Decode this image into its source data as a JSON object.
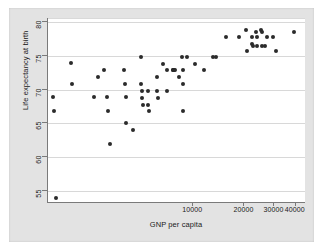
{
  "figure": {
    "background_color": "#e3e3e3",
    "plot_background_color": "#ffffff",
    "point_color": "#2b2b2b",
    "grid_color": "#d8d8d8",
    "axis_color": "#7a7a7a"
  },
  "chart_data": {
    "type": "scatter",
    "title": "",
    "xlabel": "GNP per capita",
    "ylabel": "Life expectancy at birth",
    "xscale": "log",
    "yscale": "linear",
    "grid": "horizontal",
    "legend": "none",
    "xlim": [
      1400,
      46000
    ],
    "ylim": [
      53.2,
      80.5
    ],
    "xticks": [
      10000,
      20000,
      30000,
      40000
    ],
    "xtick_labels": [
      "10000",
      "20000",
      "30000",
      "40000"
    ],
    "yticks": [
      55,
      60,
      65,
      70,
      75,
      80
    ],
    "ytick_labels": [
      "55",
      "60",
      "65",
      "70",
      "75",
      "80"
    ],
    "points": [
      {
        "x": 1500,
        "y": 68.9
      },
      {
        "x": 1520,
        "y": 66.9
      },
      {
        "x": 1560,
        "y": 54.0
      },
      {
        "x": 1900,
        "y": 74.0
      },
      {
        "x": 1950,
        "y": 70.9
      },
      {
        "x": 2600,
        "y": 68.9
      },
      {
        "x": 2750,
        "y": 71.9
      },
      {
        "x": 3000,
        "y": 72.9
      },
      {
        "x": 3100,
        "y": 68.9
      },
      {
        "x": 3150,
        "y": 66.9
      },
      {
        "x": 3250,
        "y": 62.0
      },
      {
        "x": 3900,
        "y": 72.9
      },
      {
        "x": 3950,
        "y": 70.9
      },
      {
        "x": 4000,
        "y": 68.9
      },
      {
        "x": 4050,
        "y": 65.0
      },
      {
        "x": 4400,
        "y": 64.0
      },
      {
        "x": 4900,
        "y": 74.9
      },
      {
        "x": 4950,
        "y": 70.9
      },
      {
        "x": 4980,
        "y": 69.8
      },
      {
        "x": 5000,
        "y": 68.8
      },
      {
        "x": 5050,
        "y": 67.8
      },
      {
        "x": 5400,
        "y": 69.8
      },
      {
        "x": 5450,
        "y": 67.8
      },
      {
        "x": 5500,
        "y": 66.8
      },
      {
        "x": 6100,
        "y": 71.9
      },
      {
        "x": 6150,
        "y": 69.8
      },
      {
        "x": 6200,
        "y": 68.8
      },
      {
        "x": 6600,
        "y": 73.8
      },
      {
        "x": 7000,
        "y": 72.9
      },
      {
        "x": 7050,
        "y": 69.8
      },
      {
        "x": 7600,
        "y": 72.9
      },
      {
        "x": 7650,
        "y": 72.9
      },
      {
        "x": 7700,
        "y": 72.9
      },
      {
        "x": 7800,
        "y": 72.9
      },
      {
        "x": 8200,
        "y": 71.9
      },
      {
        "x": 8600,
        "y": 74.9
      },
      {
        "x": 8650,
        "y": 72.9
      },
      {
        "x": 8700,
        "y": 70.9
      },
      {
        "x": 8750,
        "y": 66.8
      },
      {
        "x": 9200,
        "y": 74.9
      },
      {
        "x": 10200,
        "y": 73.8
      },
      {
        "x": 11500,
        "y": 72.9
      },
      {
        "x": 13000,
        "y": 74.9
      },
      {
        "x": 13600,
        "y": 74.9
      },
      {
        "x": 15500,
        "y": 77.8
      },
      {
        "x": 18500,
        "y": 77.8
      },
      {
        "x": 20500,
        "y": 78.8
      },
      {
        "x": 20800,
        "y": 75.8
      },
      {
        "x": 22000,
        "y": 77.8
      },
      {
        "x": 22200,
        "y": 76.8
      },
      {
        "x": 22500,
        "y": 76.5
      },
      {
        "x": 23500,
        "y": 78.5
      },
      {
        "x": 23600,
        "y": 77.8
      },
      {
        "x": 23800,
        "y": 76.5
      },
      {
        "x": 25000,
        "y": 78.8
      },
      {
        "x": 25200,
        "y": 78.6
      },
      {
        "x": 25500,
        "y": 76.5
      },
      {
        "x": 26500,
        "y": 76.5
      },
      {
        "x": 27000,
        "y": 77.8
      },
      {
        "x": 29500,
        "y": 77.8
      },
      {
        "x": 30500,
        "y": 75.8
      },
      {
        "x": 39000,
        "y": 78.6
      }
    ]
  }
}
